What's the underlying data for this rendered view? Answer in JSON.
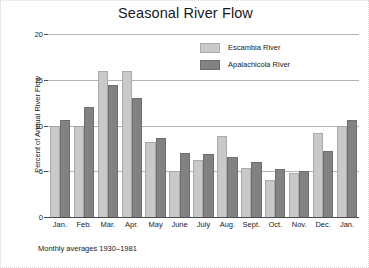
{
  "chart_data": {
    "type": "bar",
    "title": "Seasonal River Flow",
    "subtitle": "",
    "xlabel": "",
    "ylabel": "Percent of Annual River Flow",
    "ylim": [
      0,
      20
    ],
    "yticks": [
      0,
      5,
      10,
      15,
      20
    ],
    "ytick_labels": [
      "0",
      "5",
      "10",
      "15",
      "20"
    ],
    "grid": true,
    "legend_position": "top-right",
    "footnote": "Monthly averages 1930–1981",
    "categories": [
      "Jan.",
      "Feb.",
      "Mar.",
      "Apr.",
      "May",
      "June",
      "July",
      "Aug.",
      "Sept.",
      "Oct.",
      "Nov.",
      "Dec.",
      "Jan."
    ],
    "series": [
      {
        "name": "Escambia River",
        "color": "#c9c9c9",
        "values": [
          10.0,
          10.0,
          16.0,
          16.0,
          8.2,
          5.0,
          6.2,
          8.8,
          5.4,
          4.1,
          4.8,
          9.2,
          10.0
        ]
      },
      {
        "name": "Apalachicola River",
        "color": "#828282",
        "values": [
          10.6,
          12.0,
          14.4,
          13.0,
          8.6,
          7.0,
          6.9,
          6.6,
          6.0,
          5.3,
          5.0,
          7.2,
          10.6
        ]
      }
    ]
  }
}
